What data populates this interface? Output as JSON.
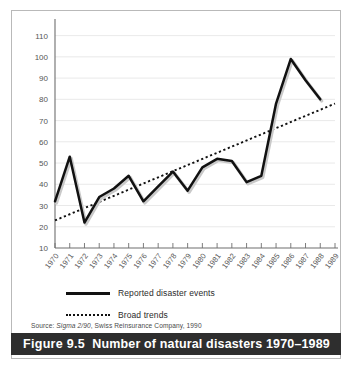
{
  "figure": {
    "caption_number": "Figure 9.5",
    "caption_title": "Number of natural disasters 1970–1989",
    "source_prefix": "Source: ",
    "source_italic": "Sigma 2/90",
    "source_rest": ", Swiss Reinsurance Company, 1990"
  },
  "legend": {
    "items": [
      {
        "label": "Reported disaster events",
        "style": "solid",
        "color": "#111111"
      },
      {
        "label": "Broad trends",
        "style": "dotted",
        "color": "#111111"
      }
    ]
  },
  "chart_data": {
    "type": "line",
    "title": "Number of natural disasters 1970–1989",
    "xlabel": "",
    "ylabel": "",
    "x": [
      1970,
      1971,
      1972,
      1973,
      1974,
      1975,
      1976,
      1977,
      1978,
      1979,
      1980,
      1981,
      1982,
      1983,
      1984,
      1985,
      1986,
      1987,
      1988,
      1989
    ],
    "categories": [
      "1970",
      "1971",
      "1972",
      "1973",
      "1974",
      "1975",
      "1976",
      "1977",
      "1978",
      "1979",
      "1980",
      "1981",
      "1982",
      "1983",
      "1984",
      "1985",
      "1986",
      "1987",
      "1988",
      "1989"
    ],
    "ylim": [
      10,
      115
    ],
    "yticks": [
      10,
      20,
      30,
      40,
      50,
      60,
      70,
      80,
      90,
      100,
      110
    ],
    "ytick_labels": [
      "10",
      "20",
      "30",
      "40",
      "50",
      "60",
      "70",
      "80",
      "90",
      "100",
      "110"
    ],
    "grid": true,
    "legend_position": "below-axes",
    "series": [
      {
        "name": "Reported disaster events",
        "style": "solid",
        "color": "#111111",
        "x": [
          1970,
          1971,
          1972,
          1973,
          1974,
          1975,
          1976,
          1977,
          1978,
          1979,
          1980,
          1981,
          1982,
          1983,
          1984,
          1985,
          1986,
          1987,
          1988
        ],
        "values": [
          32,
          53,
          22,
          34,
          38,
          44,
          32,
          39,
          46,
          37,
          48,
          52,
          51,
          41,
          44,
          78,
          99,
          89,
          80
        ]
      },
      {
        "name": "Broad trends",
        "style": "dotted",
        "color": "#111111",
        "x": [
          1970,
          1989
        ],
        "values": [
          23,
          78
        ]
      }
    ]
  }
}
